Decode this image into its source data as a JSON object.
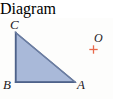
{
  "figure": {
    "background_color": "#fdfdfc",
    "shape": {
      "name": "triangle",
      "type": "right-triangle",
      "fill_color": "#a9b9d9",
      "stroke_color": "#5b6e93",
      "stroke_width": 1.4,
      "right_angle_at": "B",
      "vertices": [
        {
          "label": "C",
          "x": 15.5,
          "y": 14.5
        },
        {
          "label": "B",
          "x": 15.5,
          "y": 64.0
        },
        {
          "label": "A",
          "x": 75.0,
          "y": 64.0
        }
      ],
      "edges": [
        {
          "name": "CB",
          "from": "C",
          "to": "B"
        },
        {
          "name": "BA",
          "from": "B",
          "to": "A"
        },
        {
          "name": "AC",
          "from": "A",
          "to": "C"
        }
      ]
    },
    "labels": [
      {
        "id": "C",
        "text": "C",
        "x": 14,
        "y": 6,
        "color": "#23201e"
      },
      {
        "id": "B",
        "text": "B",
        "x": 8,
        "y": 68,
        "color": "#23201e"
      },
      {
        "id": "A",
        "text": "A",
        "x": 82,
        "y": 68,
        "color": "#23201e"
      },
      {
        "id": "O",
        "text": "O",
        "x": 99,
        "y": 22,
        "color": "#23201e"
      }
    ],
    "point_marker": {
      "name": "point-O",
      "glyph": "plus-cross",
      "color": "#e8694a",
      "x": 93.5,
      "y": 31.5,
      "arm_length": 4.2,
      "stroke_width": 1.3
    }
  }
}
